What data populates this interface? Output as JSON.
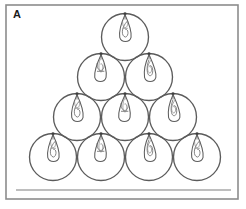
{
  "figure": {
    "panel_label": "A",
    "unit_count": 10,
    "row_count": 4
  },
  "colors": {
    "background": "#ffffff",
    "panel_border": "#8c8c8c",
    "circle_stroke": "#5b5b5b",
    "seed_stroke": "#5e5e5e",
    "seed_inner_stroke": "#6e6e6e",
    "ground_line": "#a9a9a9",
    "label_color": "#1b1b1b"
  },
  "panel": {
    "x": 6,
    "y": 5,
    "width": 232,
    "height": 194
  },
  "ground": {
    "x1": 16,
    "x2": 231,
    "y": 190
  },
  "geometry": {
    "radius": 23.5,
    "row_y": [
      37,
      77,
      117,
      157
    ],
    "row_centers": [
      [
        125
      ],
      [
        101,
        149
      ],
      [
        77,
        125,
        173
      ],
      [
        53,
        101,
        149,
        197
      ]
    ]
  },
  "units": [
    {
      "id": "unit-r1-c1",
      "row": 1,
      "col": 1,
      "cx": 125,
      "cy": 37,
      "r": 23.5,
      "seed_variant": 1
    },
    {
      "id": "unit-r2-c1",
      "row": 2,
      "col": 1,
      "cx": 101,
      "cy": 77,
      "r": 23.5,
      "seed_variant": 2
    },
    {
      "id": "unit-r2-c2",
      "row": 2,
      "col": 2,
      "cx": 149,
      "cy": 77,
      "r": 23.5,
      "seed_variant": 3
    },
    {
      "id": "unit-r3-c1",
      "row": 3,
      "col": 1,
      "cx": 77,
      "cy": 117,
      "r": 23.5,
      "seed_variant": 1
    },
    {
      "id": "unit-r3-c2",
      "row": 3,
      "col": 2,
      "cx": 125,
      "cy": 117,
      "r": 23.5,
      "seed_variant": 2
    },
    {
      "id": "unit-r3-c3",
      "row": 3,
      "col": 3,
      "cx": 173,
      "cy": 117,
      "r": 23.5,
      "seed_variant": 3
    },
    {
      "id": "unit-r4-c1",
      "row": 4,
      "col": 1,
      "cx": 53,
      "cy": 157,
      "r": 23.5,
      "seed_variant": 1
    },
    {
      "id": "unit-r4-c2",
      "row": 4,
      "col": 2,
      "cx": 101,
      "cy": 157,
      "r": 23.5,
      "seed_variant": 2
    },
    {
      "id": "unit-r4-c3",
      "row": 4,
      "col": 3,
      "cx": 149,
      "cy": 157,
      "r": 23.5,
      "seed_variant": 3
    },
    {
      "id": "unit-r4-c4",
      "row": 4,
      "col": 4,
      "cx": 197,
      "cy": 157,
      "r": 23.5,
      "seed_variant": 1
    }
  ]
}
